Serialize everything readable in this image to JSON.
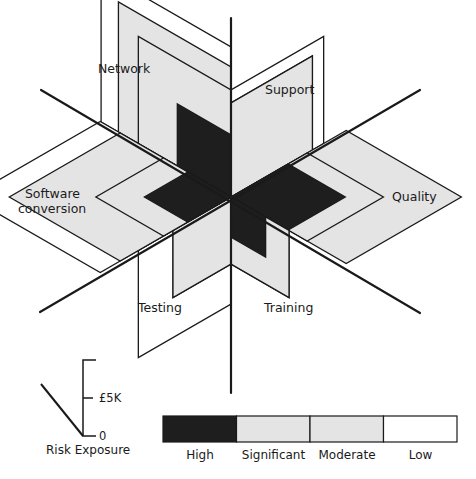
{
  "diagram": {
    "center": [
      231,
      197
    ],
    "colors": {
      "high": "#1e1e1e",
      "significant": "#e4e4e4",
      "moderate": "#e4e4e4",
      "low": "#ffffff",
      "line": "#1a1a1a"
    },
    "sectors": [
      {
        "name": "Network",
        "axes": [
          "UL",
          "U"
        ],
        "bands": {
          "low": 150,
          "moderate": 130,
          "significant": 107,
          "high": 62
        }
      },
      {
        "name": "Support",
        "axes": [
          "U",
          "UR"
        ],
        "bands": {
          "low": 107,
          "moderate": 94,
          "significant": 94,
          "high": 0
        }
      },
      {
        "name": "Quality",
        "axes": [
          "UR",
          "LR"
        ],
        "bands": {
          "low": 0,
          "moderate": 133,
          "significant": 88,
          "high": 66
        }
      },
      {
        "name": "Training",
        "axes": [
          "LR",
          "D"
        ],
        "bands": {
          "low": 0,
          "moderate": 67,
          "significant": 67,
          "high": 40
        }
      },
      {
        "name": "Testing",
        "axes": [
          "D",
          "LL"
        ],
        "bands": {
          "low": 107,
          "moderate": 67,
          "significant": 67,
          "high": 0
        }
      },
      {
        "name": "Software conversion",
        "axes": [
          "LL",
          "UL"
        ],
        "bands": {
          "low": 151,
          "moderate": 128,
          "significant": 78,
          "high": 50
        }
      }
    ],
    "labels": {
      "network": "Network",
      "support": "Support",
      "quality": "Quality",
      "training": "Training",
      "testing": "Testing",
      "software_line1": "Software",
      "software_line2": "conversion"
    }
  },
  "scale": {
    "title": "Risk Exposure",
    "tick_mid": "£5K",
    "tick_zero": "0"
  },
  "legend": {
    "items": [
      {
        "label": "High",
        "color": "#1e1e1e"
      },
      {
        "label": "Significant",
        "color": "#e4e4e4"
      },
      {
        "label": "Moderate",
        "color": "#e4e4e4"
      },
      {
        "label": "Low",
        "color": "#ffffff"
      }
    ]
  }
}
